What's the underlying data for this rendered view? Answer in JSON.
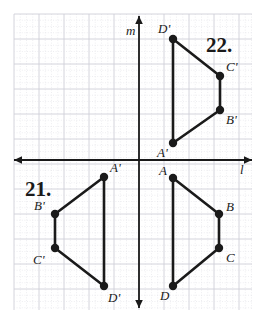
{
  "figure": {
    "width": 260,
    "height": 315,
    "background_color": "#ffffff",
    "ink_color": "#1a1a1a",
    "grid": {
      "visible": true,
      "minor_color": "#e2e2e8",
      "major_color": "#cfcfd8",
      "minor_spacing": 6.25,
      "major_spacing": 25,
      "origin_x": 139,
      "origin_y": 160,
      "left_edge": 14,
      "top_edge": 14,
      "right_edge": 252,
      "bottom_edge": 310
    },
    "axes": [
      {
        "name": "horizontal-axis",
        "label": "l",
        "orientation": "horizontal",
        "position": 160,
        "start": 14,
        "end": 252,
        "label_x": 240,
        "label_y": 174,
        "arrow_start": true,
        "arrow_end": true
      },
      {
        "name": "vertical-axis",
        "label": "m",
        "orientation": "vertical",
        "position": 139,
        "start": 16,
        "end": 308,
        "label_x": 126,
        "label_y": 35,
        "arrow_start": true,
        "arrow_end": true
      }
    ],
    "problem_labels": [
      {
        "name": "problem-number-22",
        "text": "22.",
        "x": 206,
        "y": 52
      },
      {
        "name": "problem-number-21",
        "text": "21.",
        "x": 25,
        "y": 196
      }
    ],
    "polygons": [
      {
        "name": "polygon-22-image",
        "problem": "22",
        "description": "Image quadrilateral A'B'C'D' above line l",
        "closed": true,
        "vertices": [
          {
            "label": "A'",
            "x": 173,
            "y": 143,
            "label_x": 157,
            "label_y": 157,
            "label_anchor": "start"
          },
          {
            "label": "B'",
            "x": 220,
            "y": 110,
            "label_x": 226,
            "label_y": 124,
            "label_anchor": "start"
          },
          {
            "label": "C'",
            "x": 220,
            "y": 76,
            "label_x": 226,
            "label_y": 71,
            "label_anchor": "start"
          },
          {
            "label": "D'",
            "x": 173,
            "y": 39,
            "label_x": 158,
            "label_y": 33,
            "label_anchor": "start"
          }
        ]
      },
      {
        "name": "polygon-21-preimage",
        "problem": "21",
        "description": "Pre-image quadrilateral ABCD right of line m",
        "closed": true,
        "vertices": [
          {
            "label": "A",
            "x": 173,
            "y": 178,
            "label_x": 159,
            "label_y": 175,
            "label_anchor": "start"
          },
          {
            "label": "B",
            "x": 219,
            "y": 214,
            "label_x": 226,
            "label_y": 211,
            "label_anchor": "start"
          },
          {
            "label": "C",
            "x": 219,
            "y": 248,
            "label_x": 226,
            "label_y": 262,
            "label_anchor": "start"
          },
          {
            "label": "D",
            "x": 173,
            "y": 286,
            "label_x": 160,
            "label_y": 300,
            "label_anchor": "start"
          }
        ]
      },
      {
        "name": "polygon-21-image",
        "problem": "21",
        "description": "Image quadrilateral A'B'C'D' left of line m",
        "closed": true,
        "vertices": [
          {
            "label": "A'",
            "x": 104,
            "y": 177,
            "label_x": 110,
            "label_y": 172,
            "label_anchor": "start"
          },
          {
            "label": "B'",
            "x": 55,
            "y": 214,
            "label_x": 34,
            "label_y": 210,
            "label_anchor": "start"
          },
          {
            "label": "C'",
            "x": 55,
            "y": 248,
            "label_x": 33,
            "label_y": 264,
            "label_anchor": "start"
          },
          {
            "label": "D'",
            "x": 104,
            "y": 286,
            "label_x": 108,
            "label_y": 302,
            "label_anchor": "start"
          }
        ]
      }
    ],
    "vertex_dot_radius": 4.2
  }
}
